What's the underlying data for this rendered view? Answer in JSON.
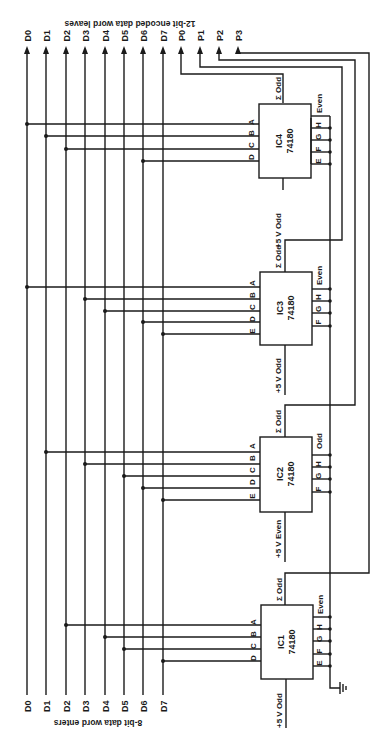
{
  "title_top": "12-bit encoded data word leaves",
  "title_bottom": "8-bit data word enters",
  "data_lines": [
    "D0",
    "D1",
    "D2",
    "D3",
    "D4",
    "D5",
    "D6",
    "D7"
  ],
  "parity_lines": [
    "P0",
    "P1",
    "P2",
    "P3"
  ],
  "supply_label": "+5 V",
  "sum_label": "Σ Odd",
  "ics": [
    {
      "name": "IC1",
      "part": "74180",
      "supply": "+5 V Odd",
      "extra_pin": "Even",
      "inputs": [
        "A",
        "B",
        "C",
        "D"
      ],
      "side_pins": [
        "H",
        "G",
        "F",
        "E"
      ],
      "data_taps": [
        "D2",
        "D4",
        "D5",
        "D7"
      ],
      "output": "P3"
    },
    {
      "name": "IC2",
      "part": "74180",
      "supply": "+5 V Even",
      "extra_pin": "Odd",
      "inputs": [
        "A",
        "B",
        "C",
        "D",
        "E"
      ],
      "side_pins": [
        "H",
        "G",
        "F"
      ],
      "data_taps": [
        "D1",
        "D3",
        "D5",
        "D6",
        "D7"
      ],
      "output": "P2"
    },
    {
      "name": "IC3",
      "part": "74180",
      "supply": "+5 V Odd",
      "extra_pin": "Even",
      "inputs": [
        "A",
        "B",
        "C",
        "D",
        "E"
      ],
      "side_pins": [
        "H",
        "G",
        "F"
      ],
      "data_taps": [
        "D0",
        "D3",
        "D4",
        "D6",
        "D7"
      ],
      "output": "P1"
    },
    {
      "name": "IC4",
      "part": "74180",
      "supply": "+5 V Odd",
      "extra_pin": "Even",
      "inputs": [
        "A",
        "B",
        "C",
        "D"
      ],
      "side_pins": [
        "H",
        "G",
        "F",
        "E"
      ],
      "data_taps": [
        "D0",
        "D1",
        "D2",
        "D6"
      ],
      "output": "P0"
    }
  ],
  "icon_names": {
    "ground": "ground-icon",
    "arrow": "arrow-up-icon"
  }
}
